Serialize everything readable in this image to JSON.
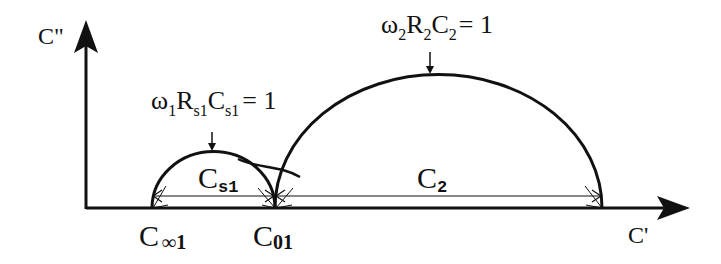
{
  "diagram": {
    "type": "cole-cole-plot",
    "axes": {
      "y_label": "C\"",
      "x_label": "C'"
    },
    "arcs": [
      {
        "name": "small-arc",
        "label": "C",
        "label_sub": "s1",
        "condition_parts": [
          "ω",
          "1",
          "R",
          "s1",
          "C",
          "s1",
          "= 1"
        ],
        "left_point": {
          "label": "C",
          "sub": "∞1"
        },
        "right_point": {
          "label": "C",
          "sub": "01"
        }
      },
      {
        "name": "large-arc",
        "label": "C",
        "label_sub": "2",
        "condition_parts": [
          "ω",
          "2",
          "R",
          "2",
          "C",
          "2",
          "= 1"
        ]
      }
    ],
    "colors": {
      "ink": "#111111",
      "background": "#ffffff"
    }
  }
}
